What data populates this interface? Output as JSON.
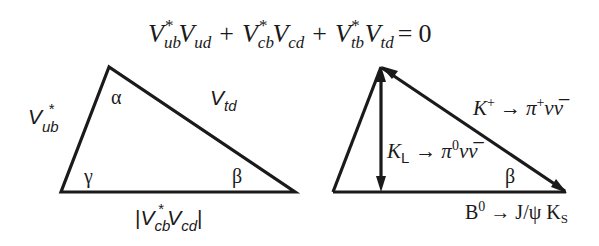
{
  "equation": {
    "terms": [
      {
        "base": "V",
        "conj_sub": "ub",
        "star": "*",
        "second_base": "V",
        "second_sub": "ud"
      },
      {
        "base": "V",
        "conj_sub": "cb",
        "star": "*",
        "second_base": "V",
        "second_sub": "cd"
      },
      {
        "base": "V",
        "conj_sub": "tb",
        "star": "*",
        "second_base": "V",
        "second_sub": "td"
      }
    ],
    "plus": "+",
    "equals": "=",
    "rhs": "0"
  },
  "left_triangle": {
    "side_left": {
      "base": "V",
      "sub": "ub",
      "star": "*"
    },
    "side_right": {
      "base": "V",
      "sub": "td"
    },
    "side_bottom": {
      "bar_open": "|",
      "base1": "V",
      "sub1": "cb",
      "star": "*",
      "base2": "V",
      "sub2": "cd",
      "bar_close": "|"
    },
    "angles": {
      "top": "α",
      "bottom_left": "γ",
      "bottom_right": "β"
    }
  },
  "right_triangle": {
    "labels": {
      "hypotenuse": {
        "k": "K",
        "k_sup": "+",
        "arrow": "→",
        "pi": "π",
        "pi_sup": "+",
        "nu": "ν",
        "nubar": "ν̅"
      },
      "height": {
        "k": "K",
        "k_sub": "L",
        "arrow": "→",
        "pi": "π",
        "pi_sup": "0",
        "nu": "ν",
        "nubar": "ν̅"
      },
      "base": {
        "b": "B",
        "b_sup": "0",
        "arrow": "→",
        "jpsi": "J/ψ",
        "k": "K",
        "k_sub": "S"
      }
    },
    "angles": {
      "bottom_right": "β"
    }
  },
  "colors": {
    "ink": "#1a1a1a",
    "background": "#ffffff"
  }
}
